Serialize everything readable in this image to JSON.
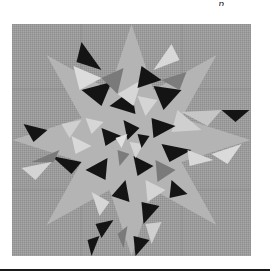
{
  "page": {
    "header_fragment": "p"
  },
  "figure": {
    "colors": {
      "background": "#9a9a9a",
      "dark": "#141414",
      "medium": "#7c7c7c",
      "light": "#d2d2d2",
      "mid_light": "#b0b0b0"
    }
  }
}
